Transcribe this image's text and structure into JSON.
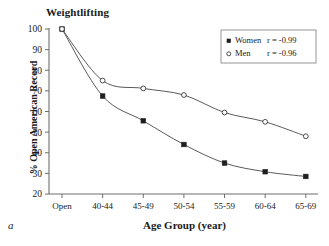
{
  "figure": {
    "panel_letter": "a"
  },
  "chart_data": {
    "type": "scatter",
    "title": "Weightlifting",
    "xlabel": "Age Group (year)",
    "ylabel": "% Open American Record",
    "categories": [
      "Open",
      "40-44",
      "45-49",
      "50-54",
      "55-59",
      "60-64",
      "65-69"
    ],
    "ylim": [
      20,
      100
    ],
    "yticks": [
      20,
      30,
      40,
      50,
      60,
      70,
      80,
      90,
      100
    ],
    "ytick_labels": [
      "20",
      "30",
      "40",
      "50",
      "60",
      "70",
      "80",
      "90",
      "100"
    ],
    "grid": false,
    "legend_position": "top-right",
    "series": [
      {
        "name": "Women",
        "marker": "filled-square",
        "correlation_label": "r = -0.99",
        "correlation": -0.99,
        "values": [
          100,
          67.5,
          55.5,
          44,
          35,
          30.8,
          28.5
        ]
      },
      {
        "name": "Men",
        "marker": "open-circle",
        "correlation_label": "r = -0.96",
        "correlation": -0.96,
        "values": [
          100,
          75,
          71.2,
          68,
          59.5,
          55,
          48
        ]
      }
    ],
    "legend": [
      {
        "label": "Women",
        "stat": "r = -0.99",
        "marker": "filled-square"
      },
      {
        "label": "Men",
        "stat": "r = -0.96",
        "marker": "open-circle"
      }
    ]
  },
  "colors": {
    "axis": "#6e6e6e",
    "curve": "#5a5a5a",
    "women_marker": "#1f1f1f",
    "men_marker": "#ffffff",
    "text": "#1a1a1a"
  }
}
